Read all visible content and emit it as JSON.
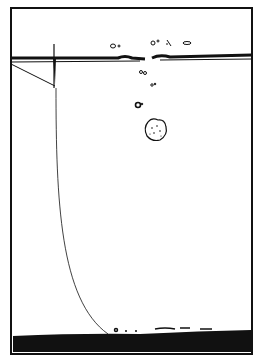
{
  "illustration": {
    "description": "Line drawing of a container of water; a stone sinks leaving bubbles, a line hangs from a post at the surface down to a dark sediment layer at the bottom",
    "colors": {
      "ink": "#111111",
      "background": "#ffffff"
    }
  }
}
